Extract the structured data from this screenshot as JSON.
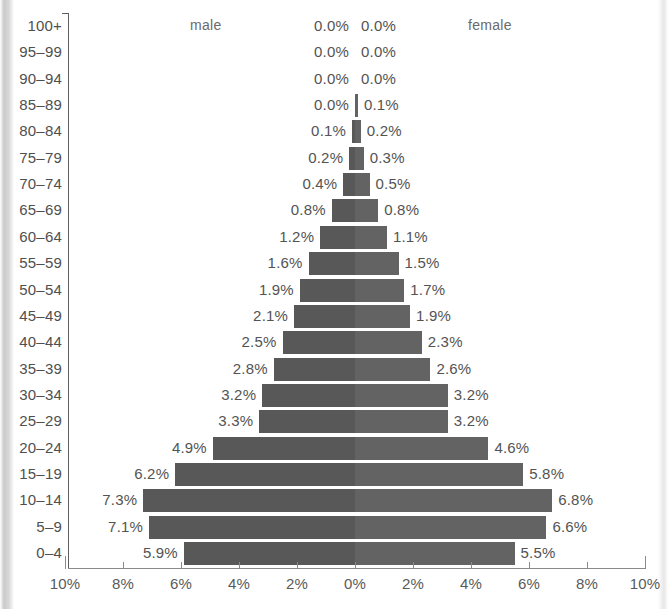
{
  "legend": {
    "male_label": "male",
    "female_label": "female"
  },
  "axis": {
    "x_tick_labels": [
      "10%",
      "8%",
      "6%",
      "4%",
      "2%",
      "0%",
      "2%",
      "4%",
      "6%",
      "8%",
      "10%"
    ],
    "x_tick_values": [
      -10,
      -8,
      -6,
      -4,
      -2,
      0,
      2,
      4,
      6,
      8,
      10
    ]
  },
  "colors": {
    "male_bar": "#585858",
    "female_bar": "#636363",
    "axis": "#5f5f5f",
    "text": "#4f4f4f",
    "background": "#ffffff"
  },
  "chart_data": {
    "type": "bar",
    "subtype": "population-pyramid",
    "title": "",
    "xlabel": "",
    "ylabel": "",
    "xlim": [
      -10,
      10
    ],
    "grid": false,
    "legend_position": "top",
    "categories": [
      "100+",
      "95–99",
      "90–94",
      "85–89",
      "80–84",
      "75–79",
      "70–74",
      "65–69",
      "60–64",
      "55–59",
      "50–54",
      "45–49",
      "40–44",
      "35–39",
      "30–34",
      "25–29",
      "20–24",
      "15–19",
      "10–14",
      "5–9",
      "0–4"
    ],
    "series": [
      {
        "name": "male",
        "side": "left",
        "values": [
          0.0,
          0.0,
          0.0,
          0.0,
          0.1,
          0.2,
          0.4,
          0.8,
          1.2,
          1.6,
          1.9,
          2.1,
          2.5,
          2.8,
          3.2,
          3.3,
          4.9,
          6.2,
          7.3,
          7.1,
          5.9
        ],
        "labels": [
          "0.0%",
          "0.0%",
          "0.0%",
          "0.0%",
          "0.1%",
          "0.2%",
          "0.4%",
          "0.8%",
          "1.2%",
          "1.6%",
          "1.9%",
          "2.1%",
          "2.5%",
          "2.8%",
          "3.2%",
          "3.3%",
          "4.9%",
          "6.2%",
          "7.3%",
          "7.1%",
          "5.9%"
        ]
      },
      {
        "name": "female",
        "side": "right",
        "values": [
          0.0,
          0.0,
          0.0,
          0.1,
          0.2,
          0.3,
          0.5,
          0.8,
          1.1,
          1.5,
          1.7,
          1.9,
          2.3,
          2.6,
          3.2,
          3.2,
          4.6,
          5.8,
          6.8,
          6.6,
          5.5
        ],
        "labels": [
          "0.0%",
          "0.0%",
          "0.0%",
          "0.1%",
          "0.2%",
          "0.3%",
          "0.5%",
          "0.8%",
          "1.1%",
          "1.5%",
          "1.7%",
          "1.9%",
          "2.3%",
          "2.6%",
          "3.2%",
          "3.2%",
          "4.6%",
          "5.8%",
          "6.8%",
          "6.6%",
          "5.5%"
        ]
      }
    ]
  }
}
